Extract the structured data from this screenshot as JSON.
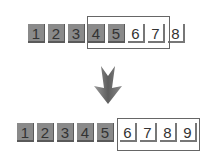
{
  "diagram": {
    "before": {
      "tiles": [
        {
          "label": "1",
          "state": "filled"
        },
        {
          "label": "2",
          "state": "filled"
        },
        {
          "label": "3",
          "state": "filled"
        },
        {
          "label": "4",
          "state": "filled"
        },
        {
          "label": "5",
          "state": "filled"
        },
        {
          "label": "6",
          "state": "empty"
        },
        {
          "label": "7",
          "state": "empty"
        },
        {
          "label": "8",
          "state": "empty"
        }
      ],
      "window": [
        "4",
        "5",
        "6",
        "7"
      ]
    },
    "transition_icon": "down-arrow-icon",
    "after": {
      "tiles": [
        {
          "label": "1",
          "state": "filled"
        },
        {
          "label": "2",
          "state": "filled"
        },
        {
          "label": "3",
          "state": "filled"
        },
        {
          "label": "4",
          "state": "filled"
        },
        {
          "label": "5",
          "state": "filled"
        },
        {
          "label": "6",
          "state": "empty"
        },
        {
          "label": "7",
          "state": "empty"
        },
        {
          "label": "8",
          "state": "empty"
        },
        {
          "label": "9",
          "state": "empty"
        }
      ],
      "window": [
        "6",
        "7",
        "8",
        "9"
      ]
    },
    "colors": {
      "filled": "#8a8a8a",
      "empty": "#ffffff",
      "frame": "#666666",
      "arrow": "#6e6e6e"
    }
  }
}
